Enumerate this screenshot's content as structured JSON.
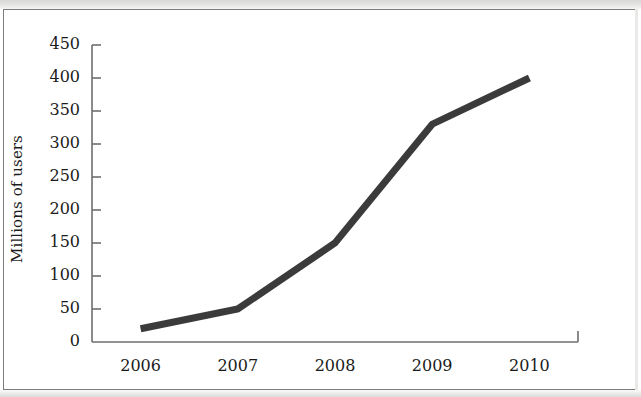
{
  "figure": {
    "kind": "line-chart-figure",
    "background_color": "#ffffff",
    "border_color": "#7d7d7d"
  },
  "chart_data": {
    "type": "line",
    "title": "",
    "subtitle": "",
    "xlabel": "",
    "ylabel": "Millions of users",
    "categories": [
      "2006",
      "2007",
      "2008",
      "2009",
      "2010"
    ],
    "values": [
      20,
      50,
      150,
      330,
      400
    ],
    "series": [
      {
        "name": "Millions of users",
        "values": [
          20,
          50,
          150,
          330,
          400
        ],
        "color": "#3b3b3b",
        "line_width": 7
      }
    ],
    "xlim": [
      "2006",
      "2010"
    ],
    "ylim": [
      0,
      450
    ],
    "ytick_labels": [
      "450",
      "400",
      "350",
      "300",
      "250",
      "200",
      "150",
      "100",
      "50",
      "0"
    ],
    "ytick_values": [
      450,
      400,
      350,
      300,
      250,
      200,
      150,
      100,
      50,
      0
    ],
    "ytick_step": 50,
    "xtick_labels": [
      "2006",
      "2007",
      "2008",
      "2009",
      "2010"
    ],
    "grid": false,
    "legend": false,
    "legend_position": "none",
    "axis_color": "#6e6e6e",
    "line_color": "#3b3b3b",
    "annotations": []
  }
}
